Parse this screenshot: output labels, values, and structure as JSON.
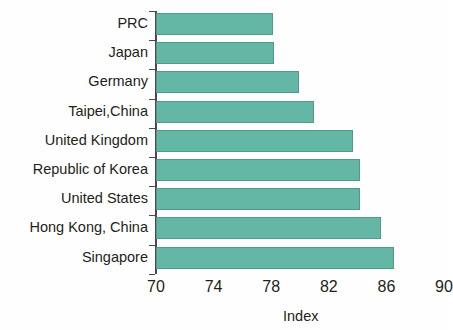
{
  "chart_data": {
    "type": "bar",
    "orientation": "horizontal",
    "title": "",
    "xlabel": "Index",
    "ylabel": "",
    "xlim": [
      70,
      90
    ],
    "xticks": [
      70,
      74,
      78,
      82,
      86,
      90
    ],
    "xtick_labels": [
      "70",
      "74",
      "78",
      "82",
      "86",
      "90"
    ],
    "grid": false,
    "legend": null,
    "bar_color": "#63b7a4",
    "bar_edge_color": "#4f9a8a",
    "axis_color": "#4a4a4a",
    "categories": [
      "PRC",
      "Japan",
      "Germany",
      "Taipei,China",
      "United Kingdom",
      "Republic of Korea",
      "United States",
      "Hong Kong, China",
      "Singapore"
    ],
    "values": [
      78.1,
      78.2,
      79.9,
      81.0,
      83.7,
      84.2,
      84.2,
      85.6,
      86.5
    ],
    "series": [
      {
        "name": "Index",
        "values": [
          78.1,
          78.2,
          79.9,
          81.0,
          83.7,
          84.2,
          84.2,
          85.6,
          86.5
        ]
      }
    ]
  }
}
